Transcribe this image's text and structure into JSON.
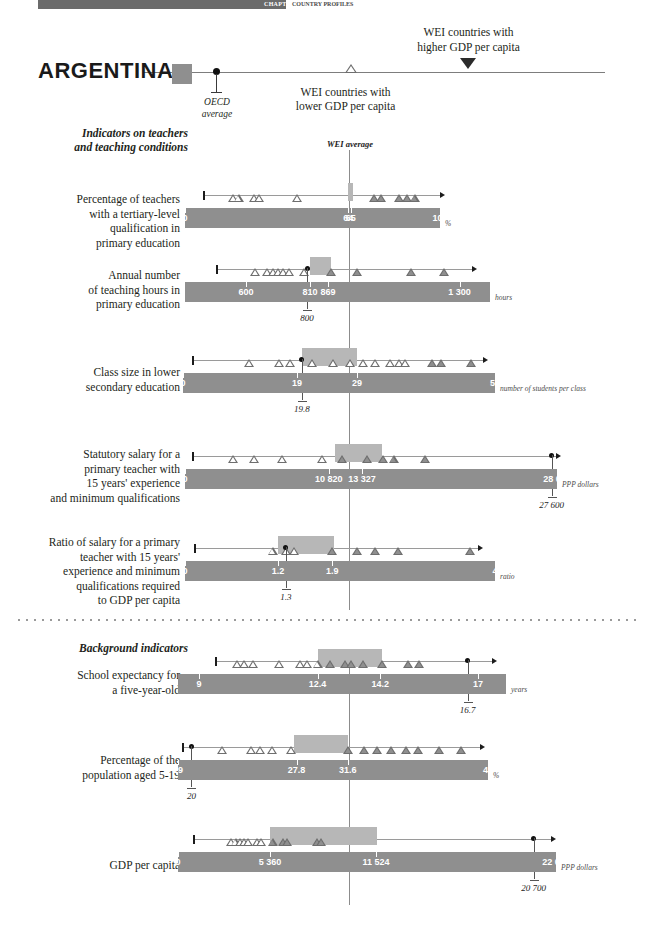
{
  "topbar": {
    "label": "CHAPTER 4",
    "sub": "COUNTRY PROFILES"
  },
  "header": {
    "country": "ARGENTINA",
    "oecd_average_line1": "OECD",
    "oecd_average_line2": "average",
    "wei_lower": "WEI countries with\nlower GDP per capita",
    "wei_higher": "WEI countries with\nhigher GDP per capita",
    "wei_average": "WEI average"
  },
  "sections": {
    "teachers": "Indicators on teachers\nand teaching conditions",
    "background": "Background indicators"
  },
  "chart_data": {
    "type": "bar",
    "legend": [
      "ARGENTINA",
      "OECD average",
      "WEI countries with lower GDP per capita",
      "WEI countries with higher GDP per capita",
      "WEI average"
    ],
    "rows": [
      {
        "label": "Percentage of teachers\nwith a tertiary-level\nqualification in\nprimary education",
        "unit": "%",
        "axis_min": 0,
        "axis_max": 100,
        "ticks": [
          0,
          64,
          65,
          100
        ],
        "tick_labels": [
          "0",
          "64",
          "65",
          "100"
        ],
        "wei_average": 64,
        "country_value": 65,
        "oecd_average": null,
        "oecd_label": null,
        "highlight": [
          64,
          66
        ],
        "range_start": 7,
        "range_end": 100,
        "markers_low": [
          19,
          21,
          27,
          29,
          44
        ],
        "markers_high": [
          74,
          77,
          84,
          87,
          90
        ]
      },
      {
        "label": "Annual number\nof teaching hours in\nprimary education",
        "unit": "hours",
        "axis_min": 400,
        "axis_max": 1400,
        "ticks": [
          600,
          810,
          869,
          1300
        ],
        "tick_labels": [
          "600",
          "810",
          "869",
          "1 300"
        ],
        "wei_average": 810,
        "country_value": 869,
        "oecd_average": 800,
        "oecd_label": "800",
        "highlight": [
          810,
          880
        ],
        "range_start": 500,
        "range_end": 1340,
        "markers_low": [
          630,
          668,
          690,
          705,
          722,
          740,
          790
        ],
        "markers_high": [
          880,
          965,
          1140,
          1250
        ]
      },
      {
        "label": "Class size in lower\nsecondary education",
        "unit": "number of students per class",
        "axis_min": 0,
        "axis_max": 52,
        "ticks": [
          0,
          19,
          29,
          52
        ],
        "tick_labels": [
          "0",
          "19",
          "29",
          "52"
        ],
        "wei_average": 29,
        "country_value": 19,
        "oecd_average": 19.8,
        "oecd_label": "19.8",
        "highlight": [
          19.8,
          29
        ],
        "range_start": 1.5,
        "range_end": 50,
        "markers_low": [
          11,
          16,
          17.8,
          21.5,
          25,
          27.8,
          30,
          32,
          34.5,
          36,
          37
        ],
        "markers_high": [
          41.5,
          43,
          48
        ]
      },
      {
        "label": "Statutory salary for a\nprimary teacher with\n15 years' experience\nand minimum qualifications",
        "unit": "PPP dollars",
        "axis_min": 0,
        "axis_max": 28000,
        "ticks": [
          0,
          10820,
          13327,
          28000
        ],
        "tick_labels": [
          "0",
          "10 820",
          "13 327",
          "28 000"
        ],
        "wei_average": 10820,
        "country_value": 13327,
        "oecd_average": 27600,
        "oecd_label": "27 600",
        "highlight": [
          11300,
          14800
        ],
        "range_start": 500,
        "range_end": 27900,
        "markers_low": [
          3600,
          5200,
          7300,
          10300
        ],
        "markers_high": [
          11800,
          13700,
          14900,
          15700,
          18100
        ]
      },
      {
        "label": "Ratio of salary for a primary\nteacher with 15 years'\nexperience and minimum\nqualifications required\nto GDP per capita",
        "unit": "ratio",
        "axis_min": 0,
        "axis_max": 4,
        "ticks": [
          0,
          1.2,
          1.9,
          4
        ],
        "tick_labels": [
          "0",
          "1.2",
          "1.9",
          "4"
        ],
        "wei_average": 1.9,
        "country_value": 1.2,
        "oecd_average": 1.3,
        "oecd_label": "1.3",
        "highlight": [
          1.2,
          1.92
        ],
        "range_start": 0.12,
        "range_end": 3.78,
        "markers_low": [
          1.13,
          1.3,
          1.41
        ],
        "markers_high": [
          1.9,
          2.22,
          2.45,
          2.75,
          3.68
        ]
      },
      {
        "label": "School expectancy for\na five-year-old",
        "unit": "years",
        "axis_min": 8.4,
        "axis_max": 17.8,
        "ticks": [
          9,
          12.4,
          14.2,
          17
        ],
        "tick_labels": [
          "9",
          "12.4",
          "14.2",
          "17"
        ],
        "wei_average": 12.4,
        "country_value": 14.2,
        "oecd_average": 16.7,
        "oecd_label": "16.7",
        "highlight": [
          12.4,
          14.25
        ],
        "range_start": 9.45,
        "range_end": 17.4,
        "markers_low": [
          10.1,
          10.3,
          10.55,
          11.3,
          11.9,
          12.1,
          12.4
        ],
        "markers_high": [
          12.75,
          13.2,
          13.35,
          13.7,
          14.25,
          15.0,
          15.3
        ]
      },
      {
        "label": "Percentage of the\npopulation aged 5-19",
        "unit": "%",
        "axis_min": 19,
        "axis_max": 42,
        "ticks": [
          19,
          27.8,
          31.6,
          42
        ],
        "tick_labels": [
          "19",
          "27.8",
          "31.6",
          "42"
        ],
        "wei_average": 31.6,
        "country_value": 27.8,
        "oecd_average": 20,
        "oecd_label": "20",
        "highlight": [
          27.6,
          31.6
        ],
        "range_start": 19.3,
        "range_end": 41.4,
        "markers_low": [
          22.3,
          24.4,
          25.1,
          26.0,
          27.4
        ],
        "markers_high": [
          31.6,
          32.8,
          33.8,
          34.8,
          35.9,
          36.8,
          38.4,
          40.0
        ]
      },
      {
        "label": "GDP per capita",
        "unit": "PPP dollars",
        "axis_min": 0,
        "axis_max": 22000,
        "ticks": [
          0,
          5360,
          11524,
          22000
        ],
        "tick_labels": [
          "0",
          "5 360",
          "11 524",
          "22 000"
        ],
        "wei_average": 5360,
        "country_value": 11524,
        "oecd_average": 20700,
        "oecd_label": "20 700",
        "highlight": [
          5360,
          11600
        ],
        "range_start": 900,
        "range_end": 21700,
        "markers_low": [
          3100,
          3350,
          3600,
          3850,
          4100,
          4600,
          4850
        ],
        "markers_high": [
          5500,
          6100,
          6350,
          8100,
          8350
        ]
      }
    ]
  }
}
